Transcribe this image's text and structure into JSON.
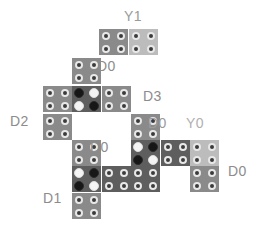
{
  "diagram": {
    "canvas": {
      "width": 264,
      "height": 225,
      "background": "#ffffff"
    },
    "palette": {
      "tile_mid_gray": "#8a8a8a",
      "tile_light_gray": "#bcbcbc",
      "tile_dark_gray": "#5e5e5e",
      "dot_ring_outer": "#e8e8e8",
      "dot_ring_inner": "#3b3b3b",
      "dot_black": "#171717",
      "dot_white": "#f4f4f4",
      "label_gray": "#8c8c8c",
      "label_light_gray": "#b0b0b0"
    },
    "labels": [
      {
        "name": "label-y1",
        "text": "Y1",
        "x": 124,
        "y": 8,
        "size": 14,
        "color": "#9a9a9a"
      },
      {
        "name": "label-d0-top",
        "text": "D0",
        "x": 97,
        "y": 58,
        "size": 14,
        "color": "#8c8c8c"
      },
      {
        "name": "label-d3",
        "text": "D3",
        "x": 143,
        "y": 88,
        "size": 14,
        "color": "#8c8c8c"
      },
      {
        "name": "label-d2",
        "text": "D2",
        "x": 10,
        "y": 113,
        "size": 14,
        "color": "#8c8c8c"
      },
      {
        "name": "label-d0-mid",
        "text": "D0",
        "x": 148,
        "y": 115,
        "size": 14,
        "color": "#9a9a9a"
      },
      {
        "name": "label-y0",
        "text": "Y0",
        "x": 186,
        "y": 115,
        "size": 14,
        "color": "#b0b0b0"
      },
      {
        "name": "label-d0-left",
        "text": "D0",
        "x": 90,
        "y": 139,
        "size": 14,
        "color": "#8c8c8c"
      },
      {
        "name": "label-d0-right",
        "text": "D0",
        "x": 228,
        "y": 163,
        "size": 14,
        "color": "#8c8c8c"
      },
      {
        "name": "label-d1",
        "text": "D1",
        "x": 43,
        "y": 190,
        "size": 14,
        "color": "#8c8c8c"
      }
    ],
    "tiles": [
      {
        "name": "tile-r0-c0",
        "x": 99,
        "y": 29,
        "w": 29,
        "h": 26,
        "fill": "#8a8a8a",
        "dots": [
          "ring",
          "ring",
          "ring",
          "ring"
        ]
      },
      {
        "name": "tile-r0-c1",
        "x": 129,
        "y": 29,
        "w": 29,
        "h": 26,
        "fill": "#bcbcbc",
        "dots": [
          "ring",
          "ring",
          "ring",
          "ring"
        ]
      },
      {
        "name": "tile-r1-c0",
        "x": 72,
        "y": 58,
        "w": 29,
        "h": 26,
        "fill": "#8a8a8a",
        "dots": [
          "ring",
          "ring",
          "ring",
          "ring"
        ]
      },
      {
        "name": "tile-r2-c0",
        "x": 43,
        "y": 86,
        "w": 29,
        "h": 26,
        "fill": "#8a8a8a",
        "dots": [
          "ring",
          "ring",
          "ring",
          "ring"
        ]
      },
      {
        "name": "tile-r2-c1",
        "x": 72,
        "y": 86,
        "w": 29,
        "h": 26,
        "fill": "#5e5e5e",
        "dots": [
          "solidblack",
          "solidwhite",
          "solidwhite",
          "solidblack"
        ]
      },
      {
        "name": "tile-r2-c2",
        "x": 102,
        "y": 86,
        "w": 29,
        "h": 26,
        "fill": "#8a8a8a",
        "dots": [
          "ring",
          "ring",
          "ring",
          "ring"
        ]
      },
      {
        "name": "tile-r3-c0",
        "x": 43,
        "y": 114,
        "w": 29,
        "h": 26,
        "fill": "#8a8a8a",
        "dots": [
          "ring",
          "ring",
          "ring",
          "ring"
        ]
      },
      {
        "name": "tile-r3-c3",
        "x": 131,
        "y": 114,
        "w": 29,
        "h": 26,
        "fill": "#8a8a8a",
        "dots": [
          "ring",
          "ring",
          "ring",
          "ring"
        ]
      },
      {
        "name": "tile-r4-c1",
        "x": 72,
        "y": 140,
        "w": 29,
        "h": 26,
        "fill": "#8a8a8a",
        "dots": [
          "ring",
          "ring",
          "ring",
          "ring"
        ]
      },
      {
        "name": "tile-r4-c3",
        "x": 131,
        "y": 140,
        "w": 29,
        "h": 26,
        "fill": "#5e5e5e",
        "dots": [
          "solidwhite",
          "solidblack",
          "solidblack",
          "solidwhite"
        ]
      },
      {
        "name": "tile-r4-c4",
        "x": 161,
        "y": 140,
        "w": 29,
        "h": 26,
        "fill": "#5e5e5e",
        "dots": [
          "ring",
          "ring",
          "ring",
          "ring"
        ]
      },
      {
        "name": "tile-r4-c5",
        "x": 190,
        "y": 140,
        "w": 29,
        "h": 26,
        "fill": "#bcbcbc",
        "dots": [
          "ring",
          "ring",
          "ring",
          "ring"
        ]
      },
      {
        "name": "tile-r5-c1",
        "x": 72,
        "y": 166,
        "w": 29,
        "h": 26,
        "fill": "#5e5e5e",
        "dots": [
          "solidwhite",
          "solidblack",
          "solidblack",
          "solidwhite"
        ]
      },
      {
        "name": "tile-r5-c2",
        "x": 102,
        "y": 166,
        "w": 29,
        "h": 26,
        "fill": "#5e5e5e",
        "dots": [
          "ring",
          "ring",
          "ring",
          "ring"
        ]
      },
      {
        "name": "tile-r5-c3",
        "x": 131,
        "y": 166,
        "w": 29,
        "h": 26,
        "fill": "#5e5e5e",
        "dots": [
          "ring",
          "ring",
          "ring",
          "ring"
        ]
      },
      {
        "name": "tile-r5-c5",
        "x": 190,
        "y": 166,
        "w": 29,
        "h": 26,
        "fill": "#8a8a8a",
        "dots": [
          "ring",
          "ring",
          "ring",
          "ring"
        ]
      },
      {
        "name": "tile-r6-c1",
        "x": 72,
        "y": 193,
        "w": 29,
        "h": 26,
        "fill": "#8a8a8a",
        "dots": [
          "ring",
          "ring",
          "ring",
          "ring"
        ]
      }
    ]
  }
}
